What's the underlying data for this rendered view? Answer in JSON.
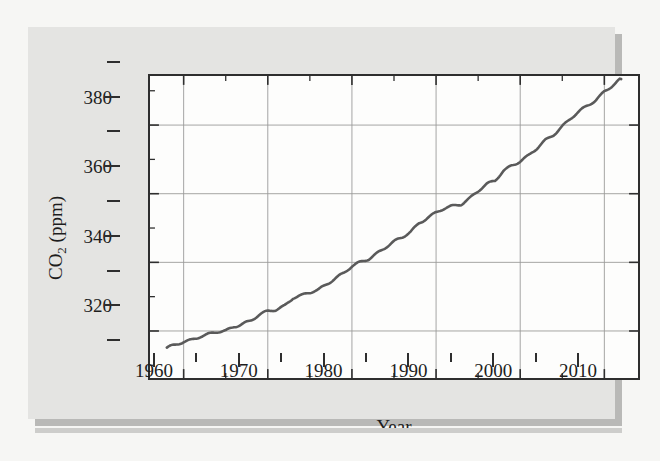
{
  "figure": {
    "panel_background": "#e4e4e2",
    "plot_background": "#fdfdfc",
    "frame_color": "#2e2e2e",
    "grid_color": "#9a9a98",
    "line_color": "#5a5a5a"
  },
  "axes": {
    "x_title": "Year",
    "y_title_main": "CO",
    "y_title_sub": "2",
    "y_title_unit": " (ppm)",
    "y_title_full": "CO2 (ppm)",
    "x_major_ticks": [
      "1960",
      "1970",
      "1980",
      "1990",
      "2000",
      "2010"
    ],
    "x_major_values": [
      1960,
      1970,
      1980,
      1990,
      2000,
      2010
    ],
    "x_minor_values": [
      1965,
      1975,
      1985,
      1995,
      2005
    ],
    "y_major_ticks": [
      "320",
      "340",
      "360",
      "380"
    ],
    "y_major_values": [
      320,
      340,
      360,
      380
    ],
    "y_minor_values": [
      310,
      330,
      350,
      370,
      390
    ]
  },
  "chart_data": {
    "type": "line",
    "title": "",
    "xlabel": "Year",
    "ylabel": "CO2 (ppm)",
    "xlim": [
      1956.0,
      2014.0
    ],
    "ylim": [
      306.3,
      394.3
    ],
    "grid": true,
    "legend": "none",
    "series": [
      {
        "name": "Atmospheric CO2 (Mauna Loa, annual mean)",
        "x": [
          1958,
          1959,
          1960,
          1961,
          1962,
          1963,
          1964,
          1965,
          1966,
          1967,
          1968,
          1969,
          1970,
          1971,
          1972,
          1973,
          1974,
          1975,
          1976,
          1977,
          1978,
          1979,
          1980,
          1981,
          1982,
          1983,
          1984,
          1985,
          1986,
          1987,
          1988,
          1989,
          1990,
          1991,
          1992,
          1993,
          1994,
          1995,
          1996,
          1997,
          1998,
          1999,
          2000,
          2001,
          2002,
          2003,
          2004,
          2005,
          2006,
          2007,
          2008,
          2009,
          2010,
          2011,
          2012
        ],
        "values": [
          315.0,
          315.8,
          316.9,
          317.6,
          318.5,
          319.0,
          319.6,
          320.0,
          321.4,
          322.2,
          323.0,
          324.6,
          325.7,
          326.3,
          327.5,
          329.7,
          330.2,
          331.1,
          332.0,
          333.8,
          335.4,
          336.8,
          338.7,
          340.0,
          341.1,
          342.8,
          344.4,
          345.9,
          347.2,
          349.0,
          351.6,
          353.1,
          354.4,
          355.6,
          356.4,
          357.1,
          358.8,
          360.8,
          362.6,
          363.7,
          366.7,
          368.4,
          369.5,
          371.0,
          373.1,
          375.6,
          377.4,
          379.7,
          381.9,
          383.8,
          385.6,
          387.4,
          389.9,
          391.6,
          393.4
        ],
        "units": "ppm"
      }
    ],
    "annual_ripple_note": "curve shows slight year-to-year wobble superposed on a rising trend"
  }
}
